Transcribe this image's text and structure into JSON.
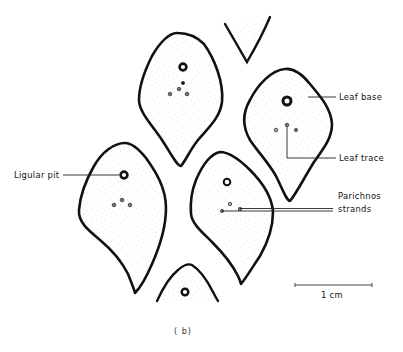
{
  "figure": {
    "panel_label": "( b)",
    "labels": {
      "leaf_base": "Leaf base",
      "leaf_trace": "Leaf trace",
      "ligular_pit": "Ligular pit",
      "parichnos_line1": "Parichnos",
      "parichnos_line2": "strands"
    },
    "scale_bar": {
      "label": "1 cm",
      "length_cm": 1
    },
    "leaf_cushions": [
      {
        "id": "top-center-partial",
        "complete": false,
        "ligular_pit": false,
        "traces": 0
      },
      {
        "id": "upper-left",
        "complete": true,
        "ligular_pit": true,
        "traces": 4
      },
      {
        "id": "right",
        "complete": true,
        "ligular_pit": true,
        "traces": 3
      },
      {
        "id": "lower-left",
        "complete": true,
        "ligular_pit": true,
        "traces": 3
      },
      {
        "id": "center",
        "complete": true,
        "ligular_pit": true,
        "traces": 3
      },
      {
        "id": "bottom-partial",
        "complete": false,
        "ligular_pit": true,
        "traces": 0
      }
    ],
    "colors": {
      "ink": "#111111",
      "stipple": "#b8b8b8",
      "background": "#ffffff"
    }
  }
}
